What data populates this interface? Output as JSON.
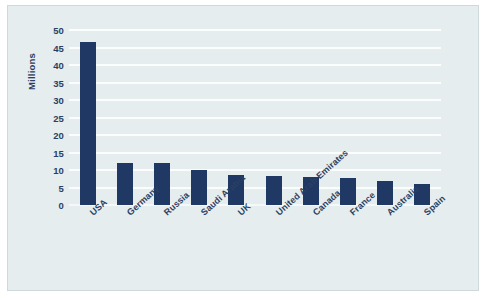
{
  "chart_data": {
    "type": "bar",
    "title": "",
    "xlabel": "",
    "ylabel": "Millions",
    "ylim": [
      0,
      50
    ],
    "ytick_step": 5,
    "yticks": [
      50,
      45,
      40,
      35,
      30,
      25,
      20,
      15,
      10,
      5,
      0
    ],
    "grid": true,
    "legend": false,
    "categories": [
      "USA",
      "Germany",
      "Russia",
      "Saudi Arabia",
      "UK",
      "United Arab Emirates",
      "Canada",
      "France",
      "Australia",
      "Spain"
    ],
    "values": [
      46.5,
      12.1,
      11.9,
      10.1,
      8.6,
      8.3,
      8.0,
      7.6,
      6.8,
      6.0
    ],
    "bar_color": "#1f3864",
    "plot_background": "#e6edef",
    "gridline_color": "#fbfdfd",
    "text_color": "#2b3f63"
  }
}
